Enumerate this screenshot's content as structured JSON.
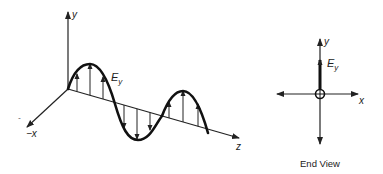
{
  "perspective_view": {
    "axes": {
      "y_label": "y",
      "neg_x_label": "−x",
      "neg_sign": "-",
      "z_label": "z"
    },
    "field_label": "E",
    "field_subscript": "y"
  },
  "end_view": {
    "axes": {
      "y_label": "y",
      "x_label": "x"
    },
    "field_label": "E",
    "field_subscript": "y",
    "caption": "End View"
  },
  "colors": {
    "ink": "#222222",
    "background": "#ffffff"
  }
}
